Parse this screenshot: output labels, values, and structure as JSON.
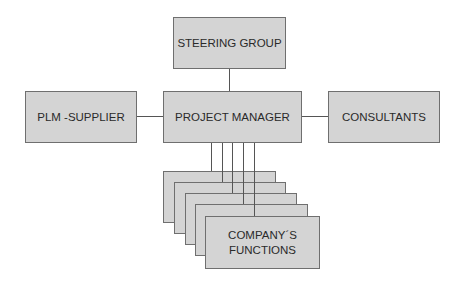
{
  "diagram": {
    "type": "organizational-chart",
    "nodes": {
      "steering_group": "STEERING GROUP",
      "plm_supplier": "PLM -SUPPLIER",
      "project_manager": "PROJECT MANAGER",
      "consultants": "CONSULTANTS",
      "company_functions_line1": "COMPANY´S",
      "company_functions_line2": "FUNCTIONS"
    },
    "edges": [
      [
        "steering_group",
        "project_manager"
      ],
      [
        "plm_supplier",
        "project_manager"
      ],
      [
        "project_manager",
        "consultants"
      ],
      [
        "project_manager",
        "company_functions (x5 stacked)"
      ]
    ],
    "stacked_function_cards": 5,
    "colors": {
      "box_fill": "#d4d4d4",
      "box_border": "#6f6f6f",
      "line": "#555555",
      "text": "#2a2a2a"
    }
  }
}
